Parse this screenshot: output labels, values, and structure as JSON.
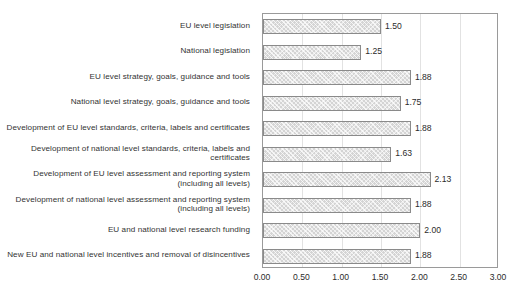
{
  "chart_data": {
    "type": "bar",
    "orientation": "horizontal",
    "title": "",
    "xlabel": "",
    "ylabel": "",
    "xlim": [
      0.0,
      3.0
    ],
    "xticks": [
      "0.00",
      "0.50",
      "1.00",
      "1.50",
      "2.00",
      "2.50",
      "3.00"
    ],
    "xtick_values": [
      0.0,
      0.5,
      1.0,
      1.5,
      2.0,
      2.5,
      3.0
    ],
    "grid": true,
    "grid_axis": "x",
    "legend": false,
    "categories": [
      "EU level legislation",
      "National legislation",
      "EU level strategy, goals, guidance and tools",
      "National level strategy, goals, guidance and tools",
      "Development of EU level standards, criteria, labels and certificates",
      "Development of national level standards, criteria, labels and certificates",
      "Development of EU level assessment and reporting system (including all levels)",
      "Development of national level assessment and reporting system (including all levels)",
      "EU and national level research funding",
      "New EU and national level incentives and removal of disincentives"
    ],
    "values": [
      1.5,
      1.25,
      1.88,
      1.75,
      1.88,
      1.63,
      2.13,
      1.88,
      2.0,
      1.88
    ],
    "value_labels": [
      "1.50",
      "1.25",
      "1.88",
      "1.75",
      "1.88",
      "1.63",
      "2.13",
      "1.88",
      "2.00",
      "1.88"
    ],
    "colors": {
      "bar_fill": "#d4d4d4",
      "bar_border": "#8a8a8a",
      "plot_border": "#9a9a9a",
      "gridline": "#e2e2e2",
      "text": "#2b2b2b"
    }
  }
}
